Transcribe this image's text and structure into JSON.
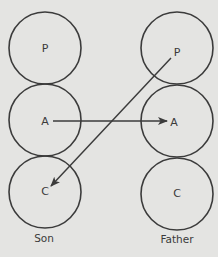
{
  "diagram": {
    "colors": {
      "background": "#e4e4e2",
      "stroke": "#3b3b3b",
      "text": "#3a3a3a"
    },
    "columns": [
      {
        "id": "son",
        "label": "Son",
        "nodes": [
          {
            "id": "son-p",
            "label": "P"
          },
          {
            "id": "son-a",
            "label": "A"
          },
          {
            "id": "son-c",
            "label": "C"
          }
        ]
      },
      {
        "id": "father",
        "label": "Father",
        "nodes": [
          {
            "id": "father-p",
            "label": "P"
          },
          {
            "id": "father-a",
            "label": "A"
          },
          {
            "id": "father-c",
            "label": "C"
          }
        ]
      }
    ],
    "edges": [
      {
        "from": "son-a",
        "to": "father-a"
      },
      {
        "from": "father-p",
        "to": "son-c"
      }
    ]
  }
}
